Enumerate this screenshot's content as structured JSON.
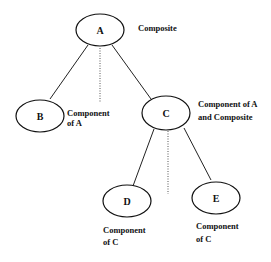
{
  "diagram": {
    "nodes": [
      {
        "id": "A",
        "label": "A",
        "cx": 100,
        "cy": 30,
        "annotation": [
          "Composite"
        ],
        "ax": 138,
        "ay": 30
      },
      {
        "id": "B",
        "label": "B",
        "cx": 40,
        "cy": 116,
        "annotation": [
          "Component",
          "of A"
        ],
        "ax": 67,
        "ay": 114
      },
      {
        "id": "C",
        "label": "C",
        "cx": 166,
        "cy": 113,
        "annotation": [
          "Component of A",
          "and Composite"
        ],
        "ax": 198,
        "ay": 107
      },
      {
        "id": "D",
        "label": "D",
        "cx": 127,
        "cy": 201,
        "annotation": [
          "Component",
          "of C"
        ],
        "ax": 103,
        "ay": 232
      },
      {
        "id": "E",
        "label": "E",
        "cx": 216,
        "cy": 198,
        "annotation": [
          "Component",
          "of C"
        ],
        "ax": 196,
        "ay": 228
      }
    ],
    "edges": [
      {
        "from": "A",
        "to": "B"
      },
      {
        "from": "A",
        "to": "C"
      },
      {
        "from": "C",
        "to": "D"
      },
      {
        "from": "C",
        "to": "E"
      }
    ],
    "dotted_separators": [
      {
        "parent": "A",
        "x": 100,
        "y1": 48,
        "y2": 102
      },
      {
        "parent": "C",
        "x": 168,
        "y1": 131,
        "y2": 194
      }
    ]
  }
}
